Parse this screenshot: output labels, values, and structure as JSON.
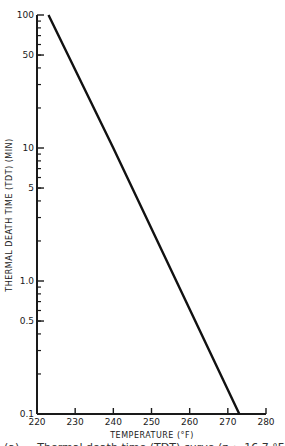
{
  "chart_data": {
    "type": "line",
    "title": "",
    "xlabel": "TEMPERATURE (°F)",
    "ylabel": "THERMAL DEATH TIME (TDT) (MIN)",
    "xlim": [
      220,
      280
    ],
    "ylim": [
      0.1,
      100
    ],
    "yscale": "log",
    "x_ticks": [
      220,
      230,
      240,
      250,
      260,
      270,
      280
    ],
    "y_ticks": [
      0.1,
      0.5,
      1.0,
      5,
      10,
      50,
      100
    ],
    "y_tick_labels": [
      "0.1",
      "0.5",
      "1.0",
      "5",
      "10",
      "50",
      "100"
    ],
    "grid": false,
    "legend": null,
    "series": [
      {
        "name": "TDT curve",
        "x": [
          223,
          240,
          256.5,
          273
        ],
        "y": [
          100,
          10,
          1.0,
          0.1
        ]
      }
    ]
  },
  "caption": "(a) — Thermal death time (TDT) curve (z ≈ 16.7 °F)"
}
